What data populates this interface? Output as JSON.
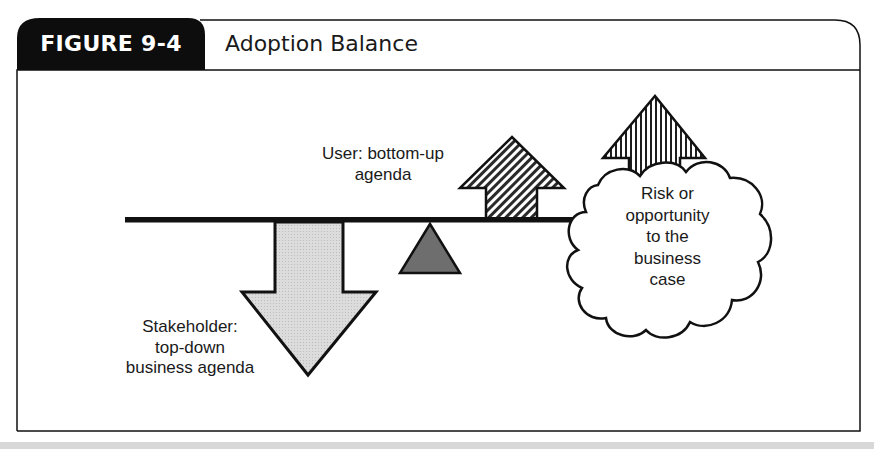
{
  "figure": {
    "number_label": "FIGURE 9-4",
    "title": "Adoption Balance"
  },
  "diagram": {
    "type": "balance-scale",
    "beam": {
      "description": "horizontal lever beam resting on a fulcrum"
    },
    "fulcrum": {
      "shape": "triangle",
      "fill": "#6e6e6e"
    },
    "forces": [
      {
        "id": "stakeholder",
        "direction": "down",
        "fill": "#d6d6d6",
        "pattern": "stipple",
        "label_lines": [
          "Stakeholder:",
          "top-down",
          "business agenda"
        ]
      },
      {
        "id": "user",
        "direction": "up",
        "fill": "#9a9a9a",
        "pattern": "diagonal-hatch",
        "label_lines": [
          "User: bottom-up",
          "agenda"
        ]
      },
      {
        "id": "risk",
        "direction": "up",
        "fill": "#ffffff",
        "pattern": "vertical-hatch",
        "label_lines": []
      }
    ],
    "cloud": {
      "label_lines": [
        "Risk or",
        "opportunity",
        "to the",
        "business",
        "case"
      ]
    }
  },
  "colors": {
    "header_tab": "#0d0d0d",
    "stroke": "#111111",
    "footer_bar": "#d8d8d8"
  }
}
